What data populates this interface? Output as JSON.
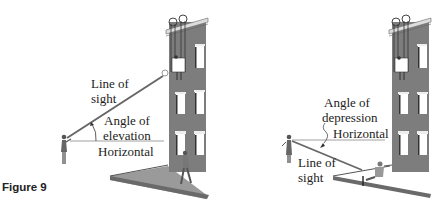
{
  "caption": "Figure 9",
  "colors": {
    "building": "#7d7d7d",
    "building_dark": "#5f5f5f",
    "window": "#ffffff",
    "line": "#444444",
    "text": "#222222"
  },
  "left_panel": {
    "title": "Angle of elevation",
    "labels": {
      "line_of_sight_1": "Line of",
      "line_of_sight_2": "sight",
      "angle_1": "Angle of",
      "angle_2": "elevation",
      "horizontal": "Horizontal"
    }
  },
  "right_panel": {
    "title": "Angle of depression",
    "labels": {
      "angle_1": "Angle of",
      "angle_2": "depression",
      "horizontal": "Horizontal",
      "line_of_sight_1": "Line of",
      "line_of_sight_2": "sight"
    }
  }
}
